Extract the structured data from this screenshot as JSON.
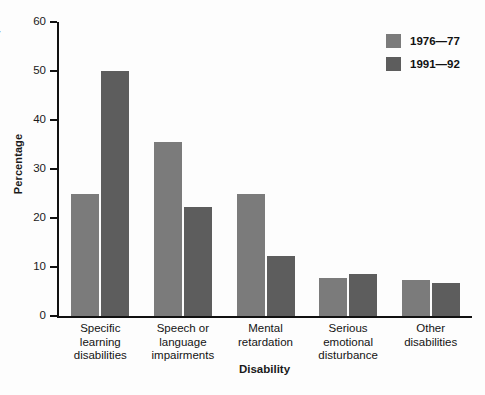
{
  "chart_data": {
    "type": "bar",
    "title": "",
    "xlabel": "Disability",
    "ylabel": "Percentage",
    "ylim": [
      0,
      60
    ],
    "yticks": [
      0,
      10,
      20,
      30,
      40,
      50,
      60
    ],
    "grid": false,
    "legend_position": "top-right",
    "categories": [
      "Specific\nlearning\ndisabilities",
      "Speech or\nlanguage\nimpairments",
      "Mental\nretardation",
      "Serious\nemotional\ndisturbance",
      "Other\ndisabilities"
    ],
    "category_lines": [
      [
        "Specific",
        "learning",
        "disabilities"
      ],
      [
        "Speech or",
        "language",
        "impairments"
      ],
      [
        "Mental",
        "retardation"
      ],
      [
        "Serious",
        "emotional",
        "disturbance"
      ],
      [
        "Other",
        "disabilities"
      ]
    ],
    "series": [
      {
        "name": "1976—77",
        "color": "#7b7b7b",
        "values": [
          25.0,
          35.5,
          25.0,
          7.7,
          7.4
        ]
      },
      {
        "name": "1991—92",
        "color": "#5d5d5d",
        "values": [
          50.0,
          22.3,
          12.3,
          8.5,
          6.7
        ]
      }
    ]
  },
  "legend": {
    "items": [
      {
        "label": "1976—77",
        "color": "#7b7b7b"
      },
      {
        "label": "1991—92",
        "color": "#5d5d5d"
      }
    ]
  },
  "axes": {
    "y_title": "Percentage",
    "x_title": "Disability",
    "y_ticks": [
      "0",
      "10",
      "20",
      "30",
      "40",
      "50",
      "60"
    ]
  },
  "edge_fragments": {
    "top_right_cut": "r",
    "low_cut_1": "·",
    "low_cut_2": "·"
  }
}
